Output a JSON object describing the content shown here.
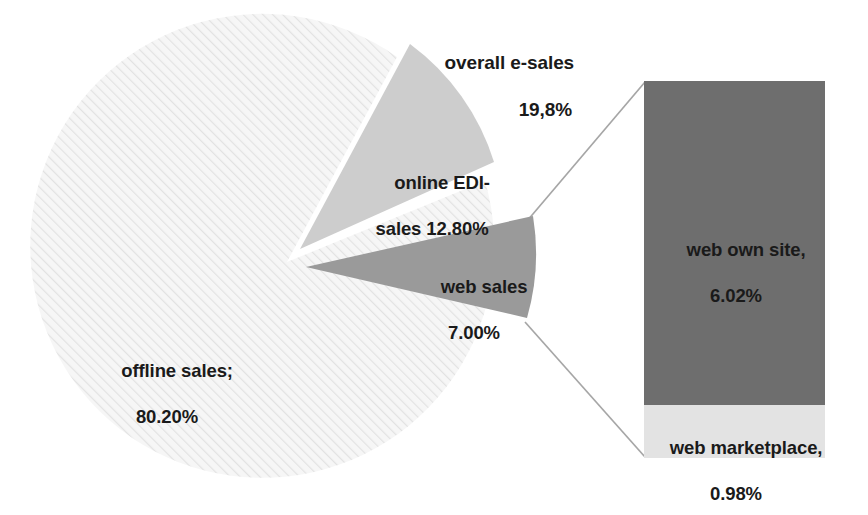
{
  "chart_data": {
    "type": "pie",
    "title": "",
    "subtitle": "",
    "xlabel": "",
    "ylabel": "",
    "legend_position": "none",
    "grid": false,
    "note": "Pie of bar: pie shows offline vs. online sales split; the web sales slice is expanded into a stacked bar on the right.",
    "categories": [
      "offline sales",
      "online EDI-sales",
      "web sales"
    ],
    "values": [
      80.2,
      12.8,
      7.0
    ],
    "units": "percent",
    "exploded": [
      "online EDI-sales",
      "web sales"
    ],
    "slices": [
      {
        "key": "offline",
        "name": "offline sales;",
        "value": 80.2,
        "value_label": "80.20%",
        "color": "#f2f2f2",
        "pattern": "diagonal-hatch",
        "exploded": false
      },
      {
        "key": "edi",
        "name": "online EDI-",
        "name_line2": "sales 12.80%",
        "value": 12.8,
        "value_label": "12.80%",
        "color": "#cdcdcd",
        "pattern": "solid",
        "exploded": true
      },
      {
        "key": "web",
        "name": "web sales",
        "value": 7.0,
        "value_label": "7.00%",
        "color": "#9a9a9a",
        "pattern": "solid",
        "exploded": true
      }
    ],
    "group_annotation": {
      "label": "overall e-sales",
      "value": 19.8,
      "value_label": "19,8%",
      "members": [
        "online EDI-sales",
        "web sales"
      ]
    },
    "breakout_bar": {
      "type": "bar",
      "of_slice": "web sales",
      "total": 7.0,
      "segments": [
        {
          "key": "own-site",
          "name": "web own site,",
          "value": 6.02,
          "value_label": "6.02%",
          "color": "#6e6e6e"
        },
        {
          "key": "marketplace",
          "name": "web marketplace,",
          "value": 0.98,
          "value_label": "0.98%",
          "color": "#e3e3e3"
        }
      ]
    }
  },
  "labels": {
    "overall": {
      "line1": "overall e-sales",
      "line2": "19,8%"
    },
    "edi": {
      "line1": "online EDI-",
      "line2": "sales 12.80%"
    },
    "web_sales": {
      "line1": "web sales",
      "line2": "7.00%"
    },
    "offline": {
      "line1": "offline sales;",
      "line2": "80.20%"
    },
    "own_site": {
      "line1": "web own site,",
      "line2": "6.02%"
    },
    "marketplace": {
      "line1": "web marketplace,",
      "line2": "0.98%"
    }
  },
  "colors": {
    "offline_slice": "#f2f2f2",
    "edi_slice": "#cdcdcd",
    "web_slice": "#9a9a9a",
    "bar_own_site": "#6e6e6e",
    "bar_marketplace": "#e3e3e3",
    "connector_line": "#a6a6a6",
    "text": "#1a1a1a",
    "background": "#ffffff"
  }
}
